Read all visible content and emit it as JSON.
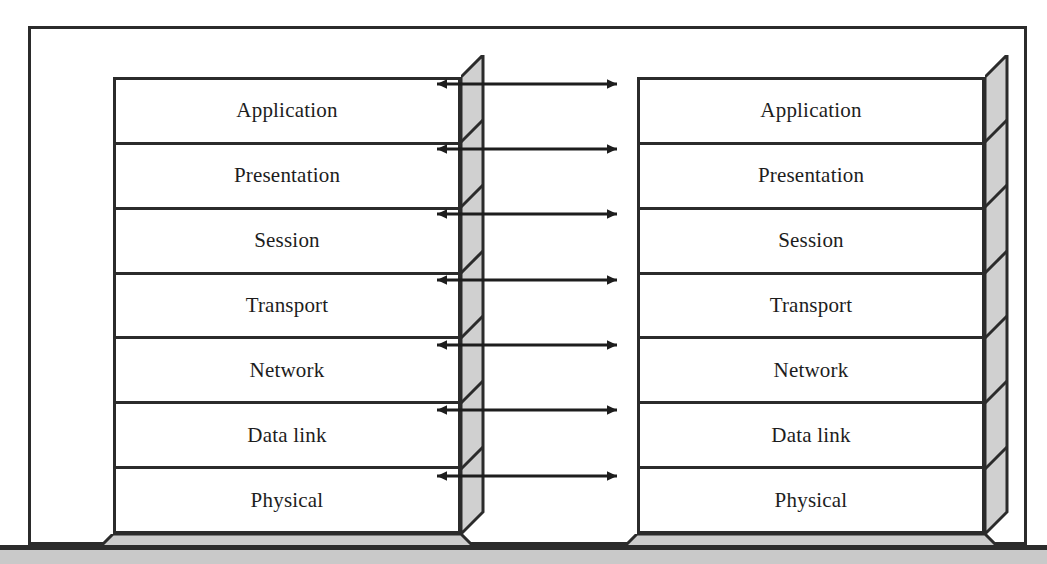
{
  "figure": {
    "layer_count": 7,
    "stack_count": 2
  },
  "colors": {
    "line": "#2b2b2b",
    "face_fill": "#ffffff",
    "side_fill": "#d0d0d0",
    "bottom_fill": "#cccccc",
    "text": "#1d1d1d",
    "page_band_dark": "#2c2c2c",
    "page_band_gray": "#c9c9c9"
  },
  "stacks": [
    {
      "id": "left-stack",
      "name": "left-protocol-stack",
      "layers": [
        {
          "label": "Application"
        },
        {
          "label": "Presentation"
        },
        {
          "label": "Session"
        },
        {
          "label": "Transport"
        },
        {
          "label": "Network"
        },
        {
          "label": "Data link"
        },
        {
          "label": "Physical"
        }
      ]
    },
    {
      "id": "right-stack",
      "name": "right-protocol-stack",
      "layers": [
        {
          "label": "Application"
        },
        {
          "label": "Presentation"
        },
        {
          "label": "Session"
        },
        {
          "label": "Transport"
        },
        {
          "label": "Network"
        },
        {
          "label": "Data link"
        },
        {
          "label": "Physical"
        }
      ]
    }
  ],
  "connections": [
    {
      "name": "peer-arrow-application",
      "layer": "Application",
      "type": "double-headed"
    },
    {
      "name": "peer-arrow-presentation",
      "layer": "Presentation",
      "type": "double-headed"
    },
    {
      "name": "peer-arrow-session",
      "layer": "Session",
      "type": "double-headed"
    },
    {
      "name": "peer-arrow-transport",
      "layer": "Transport",
      "type": "double-headed"
    },
    {
      "name": "peer-arrow-network",
      "layer": "Network",
      "type": "double-headed"
    },
    {
      "name": "peer-arrow-datalink",
      "layer": "Data link",
      "type": "double-headed"
    },
    {
      "name": "peer-arrow-physical",
      "layer": "Physical",
      "type": "double-headed"
    }
  ]
}
